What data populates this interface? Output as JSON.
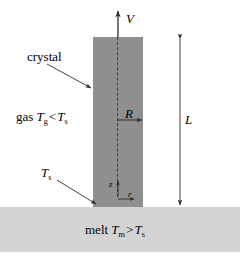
{
  "figure": {
    "colors": {
      "crystal_fill": "#8f8f8f",
      "melt_fill": "#d4d4d4",
      "background": "#ffffff",
      "line": "#3b3b3b",
      "text": "#000000"
    }
  },
  "labels": {
    "crystal": "crystal",
    "gas_prefix": "gas",
    "melt_prefix": "melt",
    "pull_velocity": "V",
    "radius": "R",
    "length": "L",
    "axial_coordinate": "z",
    "radial_coordinate": "r",
    "surface_temperature": "T",
    "surface_temperature_sub": "s",
    "gas_temperature": "T",
    "gas_temperature_sub": "g",
    "gas_compare_op": "<",
    "gas_compare_rhs": "T",
    "gas_compare_rhs_sub": "s",
    "melt_temperature": "T",
    "melt_temperature_sub": "m",
    "melt_compare_op": ">",
    "melt_compare_rhs": "T",
    "melt_compare_rhs_sub": "s"
  },
  "geometry": {
    "crystal_left": 93,
    "crystal_right": 143,
    "crystal_top": 37,
    "crystal_bottom": 207,
    "centerline_x": 118,
    "melt_top": 207,
    "melt_bottom": 252,
    "length_dim_x": 180,
    "radius_arrow_y": 120
  }
}
